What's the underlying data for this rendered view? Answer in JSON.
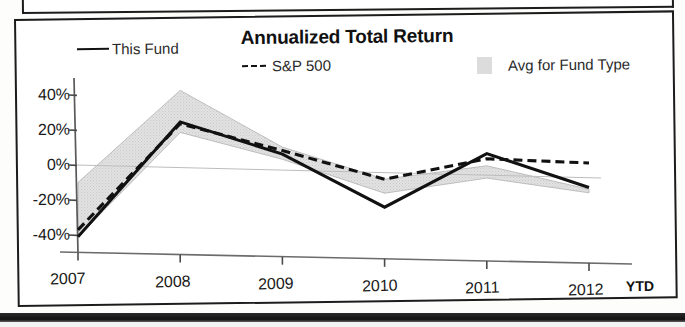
{
  "chart": {
    "title": "Annualized Total Return",
    "ytd_note": "YTD"
  },
  "legend": [
    {
      "label": "This Fund",
      "style": "solid-line",
      "color": "#111111"
    },
    {
      "label": "S&P 500",
      "style": "dashed-line",
      "color": "#111111"
    },
    {
      "label": "Avg for Fund Type",
      "style": "filled-band",
      "color": "#dcdcdc"
    }
  ],
  "axis": {
    "y_ticks": [
      "40%",
      "20%",
      "0%",
      "-20%",
      "-40%"
    ],
    "x_ticks": [
      "2007",
      "2008",
      "2009",
      "2010",
      "2011",
      "2012"
    ]
  },
  "chart_data": {
    "type": "line",
    "title": "Annualized Total Return",
    "xlabel": "",
    "ylabel": "",
    "categories": [
      "2007",
      "2008",
      "2009",
      "2010",
      "2011",
      "2012"
    ],
    "ylim": [
      -50,
      48
    ],
    "ytick_values": [
      40,
      20,
      0,
      -20,
      -40
    ],
    "grid": false,
    "legend_position": "top",
    "series": [
      {
        "name": "This Fund",
        "style": "solid",
        "color": "#111111",
        "values": [
          -41,
          26,
          9,
          -20,
          12,
          -6
        ]
      },
      {
        "name": "S&P 500",
        "style": "dashed",
        "color": "#111111",
        "values": [
          -37,
          25,
          11,
          -4,
          9,
          8
        ]
      },
      {
        "name": "Avg for Fund Type",
        "style": "band",
        "color": "#dcdcdc",
        "upper": [
          -10,
          44,
          13,
          -4,
          5,
          -7
        ],
        "lower": [
          -41,
          20,
          6,
          -12,
          -2,
          -9
        ]
      }
    ],
    "annotations": [
      "YTD"
    ]
  }
}
